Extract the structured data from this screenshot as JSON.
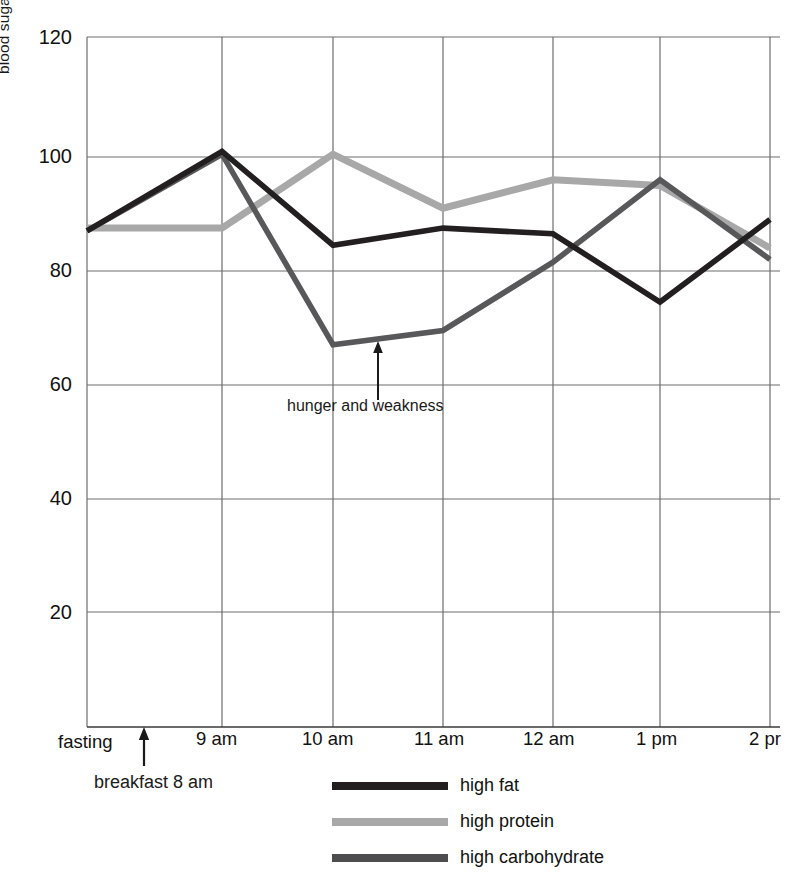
{
  "chart_data": {
    "type": "line",
    "title": "",
    "xlabel": "",
    "ylabel": "blood sugar mg. per 100 cc",
    "categories": [
      "fasting",
      "9 am",
      "10 am",
      "11 am",
      "12 am",
      "1 pm",
      "2 pm"
    ],
    "x_tick_labels": [
      "fasting",
      "9 am",
      "10 am",
      "11 am",
      "12 am",
      "1 pm",
      "2 pr"
    ],
    "y_tick_labels": [
      "120",
      "100",
      "80",
      "60",
      "40",
      "20"
    ],
    "y_ticks": [
      120,
      100,
      80,
      60,
      40,
      20
    ],
    "ylim": [
      0,
      120
    ],
    "grid": true,
    "legend_position": "bottom",
    "series": [
      {
        "name": "high fat",
        "color": "#231f20",
        "values": [
          87,
          101,
          84.5,
          87.5,
          86.5,
          74.5,
          89
        ]
      },
      {
        "name": "high protein",
        "color": "#a8a8a8",
        "values": [
          87.5,
          87.5,
          100.5,
          91,
          96,
          95,
          84
        ]
      },
      {
        "name": "high carbohydrate",
        "color": "#58585a",
        "values": [
          87,
          100.5,
          67,
          69.5,
          81.5,
          96,
          82
        ]
      }
    ],
    "annotations": [
      {
        "text": "hunger and weakness",
        "x_value": "10 am",
        "y_value": 62,
        "arrow": "up"
      },
      {
        "text": "fasting",
        "x_value": "fasting"
      },
      {
        "text": "breakfast   8 am",
        "x_value": "fasting",
        "arrow": "up"
      }
    ]
  },
  "axis": {
    "y_label": "blood sugar mg. per 100 cc",
    "y_ticks": [
      "120",
      "100",
      "80",
      "60",
      "40",
      "20"
    ],
    "x_ticks": [
      "fasting",
      "9 am",
      "10 am",
      "11 am",
      "12 am",
      "1 pm",
      "2 pr"
    ]
  },
  "annotations": {
    "hunger": "hunger and weakness",
    "fasting": "fasting",
    "breakfast": "breakfast   8 am"
  },
  "legend": {
    "items": [
      {
        "label": "high fat",
        "color": "#231f20"
      },
      {
        "label": "high protein",
        "color": "#a8a8a8"
      },
      {
        "label": "high carbohydrate",
        "color": "#4d4d4f"
      }
    ]
  }
}
